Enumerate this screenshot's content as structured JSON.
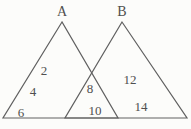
{
  "figure": {
    "triangle_a": {
      "label": "A",
      "values": [
        "2",
        "4",
        "6"
      ]
    },
    "triangle_b": {
      "label": "B",
      "values": [
        "12",
        "14"
      ]
    },
    "intersection": {
      "values": [
        "8",
        "10"
      ]
    },
    "colors": {
      "line": "#606060",
      "text": "#4f4f4f",
      "background": "#fcfcfa"
    }
  }
}
